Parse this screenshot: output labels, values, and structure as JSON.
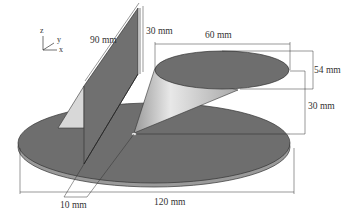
{
  "diagram": {
    "axes": {
      "z": "z",
      "y": "y",
      "x": "x"
    },
    "dimensions": {
      "plate_length": "90 mm",
      "plate_offset_height": "30 mm",
      "top_ellipse_width": "60 mm",
      "top_ellipse_depth": "54 mm",
      "cone_height": "30 mm",
      "plate_thickness_gap": "10 mm",
      "base_diameter": "120 mm"
    },
    "colors": {
      "base_disk": "#6e6e6e",
      "base_edge": "#9a9a9a",
      "cone_light": "#e6e6e6",
      "cone_dark": "#8a8a8a",
      "plate": "#707070",
      "triangle": "#d8d8d8",
      "dim_line": "#333333"
    }
  }
}
